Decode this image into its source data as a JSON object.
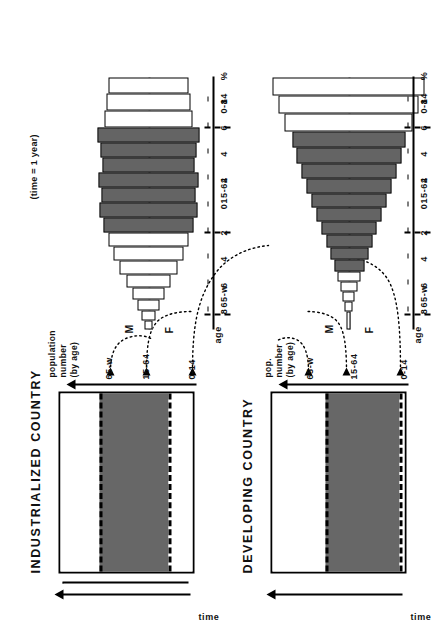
{
  "figure": {
    "note": "(time = 1 year)",
    "time_axis_label": "time",
    "age_label": "age",
    "male_label": "M",
    "female_label": "F"
  },
  "panels": [
    {
      "id": "industrialized",
      "title": "INDUSTRIALIZED COUNTRY",
      "value_axis_label_line1": "population",
      "value_axis_label_line2": "number",
      "value_axis_label_line3": "(by age)",
      "categories": [
        "0-14",
        "15-64",
        "65-w"
      ],
      "bar_segments": [
        {
          "label": "0-14",
          "fill": "white",
          "fraction": 0.22
        },
        {
          "label": "15-64",
          "fill": "shaded",
          "fraction": 0.6
        },
        {
          "label": "65-w",
          "fill": "white",
          "fraction": 0.18
        }
      ]
    },
    {
      "id": "developing",
      "title": "DEVELOPING COUNTRY",
      "value_axis_label_line1": "pop.",
      "value_axis_label_line2": "number",
      "value_axis_label_line3": "(by age)",
      "categories": [
        "0-14",
        "15-64",
        "65-w"
      ],
      "bar_segments": [
        {
          "label": "0-14",
          "fill": "white",
          "fraction": 0.37
        },
        {
          "label": "15-64",
          "fill": "shaded",
          "fraction": 0.58
        },
        {
          "label": "65-w",
          "fill": "white",
          "fraction": 0.05
        }
      ]
    }
  ],
  "chart_data": [
    {
      "type": "bar",
      "id": "industrialized-pyramid",
      "title": "INDUSTRIALIZED COUNTRY",
      "subtitle": "population pyramid",
      "xlabel": "%",
      "ylabel": "age",
      "xlim": [
        -8,
        8
      ],
      "xticks": [
        "8",
        "6",
        "4",
        "2",
        "0",
        "2",
        "4",
        "6",
        "8"
      ],
      "xtick_unit": "%",
      "grid": false,
      "legend": [
        "M",
        "F"
      ],
      "age_groups": [
        "0-14",
        "15-64",
        "65-w"
      ],
      "series": [
        {
          "name": "M",
          "values": [
            3.9,
            3.9,
            4.0,
            4.1,
            4.2,
            4.3,
            4.2,
            3.6,
            3.4,
            3.3,
            3.0,
            2.6,
            2.1,
            1.5,
            1.0,
            0.6,
            0.3
          ]
        },
        {
          "name": "F",
          "values": [
            3.7,
            3.7,
            3.8,
            3.9,
            4.0,
            4.1,
            4.0,
            3.5,
            3.4,
            3.4,
            3.2,
            2.9,
            2.5,
            1.9,
            1.3,
            0.8,
            0.4
          ]
        }
      ],
      "shaded_bands_age_group": "15-64",
      "notes": "near-rectangular / column shape: low birth rate, long life expectancy"
    },
    {
      "type": "bar",
      "id": "developing-pyramid",
      "title": "DEVELOPING COUNTRY",
      "subtitle": "population pyramid",
      "xlabel": "%",
      "ylabel": "age",
      "xlim": [
        -8,
        8
      ],
      "xticks": [
        "8",
        "6",
        "4",
        "2",
        "0",
        "2",
        "4",
        "6",
        "8"
      ],
      "xtick_unit": "%",
      "grid": false,
      "legend": [
        "M",
        "F"
      ],
      "age_groups": [
        "0-14",
        "15-64",
        "65-w"
      ],
      "series": [
        {
          "name": "M",
          "values": [
            7.6,
            6.4,
            5.4,
            4.6,
            3.9,
            3.3,
            2.8,
            2.3,
            1.9,
            1.5,
            1.2,
            0.9,
            0.7,
            0.5,
            0.3,
            0.2,
            0.1
          ]
        },
        {
          "name": "F",
          "values": [
            7.4,
            6.2,
            5.2,
            4.4,
            3.7,
            3.2,
            2.7,
            2.2,
            1.8,
            1.5,
            1.2,
            0.9,
            0.7,
            0.5,
            0.3,
            0.2,
            0.1
          ]
        }
      ],
      "shaded_bands_age_group": "15-64",
      "notes": "broad-based triangle: high birth rate, short life expectancy"
    },
    {
      "type": "bar",
      "id": "industrialized-timebar",
      "title": "INDUSTRIALIZED COUNTRY",
      "xlabel": "population number (by age)",
      "ylabel": "time",
      "categories": [
        "0-14",
        "15-64",
        "65-w"
      ],
      "values": [
        22,
        60,
        18
      ],
      "unit": "% of population"
    },
    {
      "type": "bar",
      "id": "developing-timebar",
      "title": "DEVELOPING COUNTRY",
      "xlabel": "pop. number (by age)",
      "ylabel": "time",
      "categories": [
        "0-14",
        "15-64",
        "65-w"
      ],
      "values": [
        37,
        58,
        5
      ],
      "unit": "% of population"
    }
  ],
  "axis_ticks": [
    "%",
    "8",
    "6",
    "4",
    "2",
    "0",
    "2",
    "4",
    "6",
    "8"
  ]
}
